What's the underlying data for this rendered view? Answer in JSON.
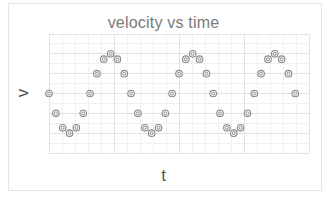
{
  "chart_data": {
    "type": "scatter",
    "title": "velocity vs time",
    "xlabel": "t",
    "ylabel": "v",
    "xlim": [
      0,
      38
    ],
    "ylim": [
      -3,
      3
    ],
    "grid": true,
    "legend": null,
    "x_tick_labels": [],
    "y_tick_labels": [],
    "series": [
      {
        "name": "v",
        "marker": "double-circle",
        "color": "#8a8a8a",
        "x": [
          0,
          1,
          2,
          3,
          4,
          5,
          6,
          7,
          8,
          9,
          10,
          11,
          12,
          13,
          14,
          15,
          16,
          17,
          18,
          19,
          20,
          21,
          22,
          23,
          24,
          25,
          26,
          27,
          28,
          29,
          30,
          31,
          32,
          33,
          34,
          35,
          36
        ],
        "y": [
          0,
          -1,
          -1.73,
          -2,
          -1.73,
          -1,
          0,
          1,
          1.73,
          2,
          1.73,
          1,
          0,
          -1,
          -1.73,
          -2,
          -1.73,
          -1,
          0,
          1,
          1.73,
          2,
          1.73,
          1,
          0,
          -1,
          -1.73,
          -2,
          -1.73,
          -1,
          0,
          1,
          1.73,
          2,
          1.73,
          1,
          0
        ]
      }
    ]
  },
  "colors": {
    "title": "#7a7a7a",
    "marker": "#8a8a8a",
    "grid_major": "#e2e2e2",
    "grid_minor": "#f1f1f1",
    "frame": "#e4e4e4"
  }
}
